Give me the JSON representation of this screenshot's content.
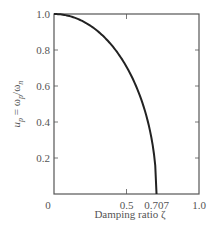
{
  "chart_data": {
    "type": "line",
    "title": "",
    "xlabel": "Damping ratio ζ",
    "ylabel": "u_p = ω_p / ω_n",
    "xlim": [
      0,
      1.0
    ],
    "ylim": [
      0,
      1.0
    ],
    "x_ticks": [
      {
        "value": 0,
        "label": "0"
      },
      {
        "value": 0.5,
        "label": "0.5"
      },
      {
        "value": 0.707,
        "label": "0.707"
      },
      {
        "value": 1.0,
        "label": "1.0"
      }
    ],
    "y_ticks": [
      {
        "value": 0.2,
        "label": "0.2"
      },
      {
        "value": 0.4,
        "label": "0.4"
      },
      {
        "value": 0.6,
        "label": "0.6"
      },
      {
        "value": 0.8,
        "label": "0.8"
      },
      {
        "value": 1.0,
        "label": "1.0"
      }
    ],
    "grid": false,
    "legend": null,
    "series": [
      {
        "name": "u_p = sqrt(1 - 2ζ²)",
        "x": [
          0,
          0.1,
          0.2,
          0.3,
          0.4,
          0.5,
          0.6,
          0.65,
          0.7,
          0.707
        ],
        "values": [
          1.0,
          0.99,
          0.959,
          0.906,
          0.825,
          0.707,
          0.529,
          0.392,
          0.141,
          0.0
        ]
      }
    ],
    "colors": {
      "curve": "#222222",
      "axes": "#555555"
    }
  },
  "labels": {
    "xlabel": "Damping ratio ζ",
    "y_u": "u",
    "y_p": "p",
    "y_eq": " = ω",
    "y_p2": "p",
    "y_slash": "/ω",
    "y_n": "n"
  }
}
